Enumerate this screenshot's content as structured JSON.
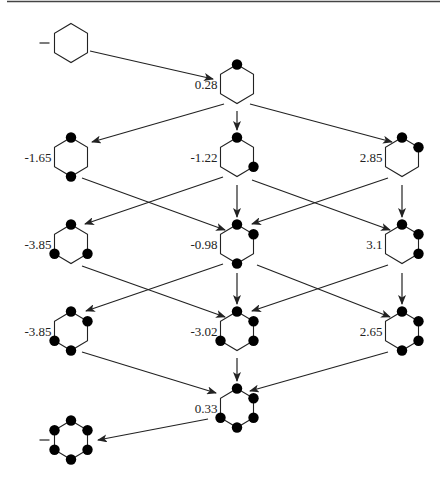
{
  "figure": {
    "border_color": "#444444",
    "line_color": "#222222",
    "dot_color": "#000000"
  },
  "nodes": [
    {
      "id": "start",
      "label": "",
      "cx": 71,
      "cy": 43,
      "filled": [],
      "lead_dash": true
    },
    {
      "id": "n1",
      "label": "0.28",
      "cx": 237,
      "cy": 84,
      "filled": [
        0
      ]
    },
    {
      "id": "n2a",
      "label": "-1.65",
      "cx": 71,
      "cy": 157,
      "filled": [
        0,
        3
      ]
    },
    {
      "id": "n2b",
      "label": "-1.22",
      "cx": 237,
      "cy": 157,
      "filled": [
        0,
        2
      ]
    },
    {
      "id": "n2c",
      "label": "2.85",
      "cx": 402,
      "cy": 157,
      "filled": [
        0,
        1
      ]
    },
    {
      "id": "n3a",
      "label": "-3.85",
      "cx": 71,
      "cy": 244,
      "filled": [
        0,
        2,
        4
      ]
    },
    {
      "id": "n3b",
      "label": "-0.98",
      "cx": 237,
      "cy": 244,
      "filled": [
        0,
        1,
        3
      ]
    },
    {
      "id": "n3c",
      "label": "3.1",
      "cx": 402,
      "cy": 244,
      "filled": [
        0,
        1,
        2
      ]
    },
    {
      "id": "n4a",
      "label": "-3.85",
      "cx": 71,
      "cy": 331,
      "filled": [
        0,
        1,
        3,
        4
      ]
    },
    {
      "id": "n4b",
      "label": "-3.02",
      "cx": 237,
      "cy": 331,
      "filled": [
        0,
        1,
        2,
        4
      ]
    },
    {
      "id": "n4c",
      "label": "2.65",
      "cx": 402,
      "cy": 331,
      "filled": [
        0,
        1,
        2,
        3
      ]
    },
    {
      "id": "n5",
      "label": "0.33",
      "cx": 237,
      "cy": 408,
      "filled": [
        0,
        1,
        2,
        3,
        4
      ]
    },
    {
      "id": "end",
      "label": "",
      "cx": 71,
      "cy": 440,
      "filled": [
        0,
        1,
        2,
        3,
        4,
        5
      ],
      "lead_dash": true
    }
  ],
  "arrows": [
    {
      "from": "start",
      "to": "n1",
      "x1": 90,
      "y1": 51,
      "x2": 213,
      "y2": 79
    },
    {
      "from": "n1",
      "to": "n2a",
      "x1": 224,
      "y1": 104,
      "x2": 92,
      "y2": 142
    },
    {
      "from": "n1",
      "to": "n2b",
      "x1": 237,
      "y1": 111,
      "x2": 237,
      "y2": 130
    },
    {
      "from": "n1",
      "to": "n2c",
      "x1": 250,
      "y1": 104,
      "x2": 392,
      "y2": 142
    },
    {
      "from": "n2a",
      "to": "n3b",
      "x1": 82,
      "y1": 178,
      "x2": 225,
      "y2": 230
    },
    {
      "from": "n2b",
      "to": "n3a",
      "x1": 223,
      "y1": 177,
      "x2": 85,
      "y2": 224
    },
    {
      "from": "n2b",
      "to": "n3b",
      "x1": 237,
      "y1": 185,
      "x2": 237,
      "y2": 217
    },
    {
      "from": "n2b",
      "to": "n3c",
      "x1": 252,
      "y1": 180,
      "x2": 390,
      "y2": 230
    },
    {
      "from": "n2c",
      "to": "n3b",
      "x1": 388,
      "y1": 178,
      "x2": 252,
      "y2": 224
    },
    {
      "from": "n2c",
      "to": "n3c",
      "x1": 402,
      "y1": 185,
      "x2": 402,
      "y2": 217
    },
    {
      "from": "n3a",
      "to": "n4b",
      "x1": 82,
      "y1": 266,
      "x2": 225,
      "y2": 317
    },
    {
      "from": "n3b",
      "to": "n4a",
      "x1": 223,
      "y1": 264,
      "x2": 86,
      "y2": 311
    },
    {
      "from": "n3b",
      "to": "n4b",
      "x1": 237,
      "y1": 273,
      "x2": 237,
      "y2": 304
    },
    {
      "from": "n3b",
      "to": "n4c",
      "x1": 257,
      "y1": 265,
      "x2": 390,
      "y2": 317
    },
    {
      "from": "n3c",
      "to": "n4b",
      "x1": 388,
      "y1": 265,
      "x2": 252,
      "y2": 311
    },
    {
      "from": "n3c",
      "to": "n4c",
      "x1": 402,
      "y1": 273,
      "x2": 402,
      "y2": 304
    },
    {
      "from": "n4a",
      "to": "n5",
      "x1": 82,
      "y1": 352,
      "x2": 216,
      "y2": 393
    },
    {
      "from": "n4b",
      "to": "n5",
      "x1": 237,
      "y1": 358,
      "x2": 237,
      "y2": 381
    },
    {
      "from": "n4c",
      "to": "n5",
      "x1": 388,
      "y1": 352,
      "x2": 250,
      "y2": 391
    },
    {
      "from": "n5",
      "to": "end",
      "x1": 208,
      "y1": 419,
      "x2": 98,
      "y2": 440
    }
  ]
}
